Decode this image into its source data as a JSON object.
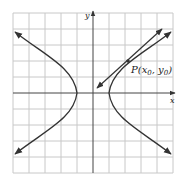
{
  "figure": {
    "axis_x_label": "x",
    "axis_y_label": "y",
    "point_label_prefix": "P(x",
    "point_label_sub0": "0",
    "point_label_mid": ", y",
    "point_label_sub1": "0",
    "point_label_suffix": ")",
    "grid": {
      "cells": 10,
      "range": [
        -5,
        5
      ]
    },
    "hyperbola": {
      "a": 1,
      "b": 0.82,
      "orientation": "horizontal"
    },
    "point": {
      "x": 2.2,
      "y": 1.95
    },
    "colors": {
      "grid": "#c8c8c8",
      "curve": "#333333",
      "axis": "#444444"
    }
  }
}
